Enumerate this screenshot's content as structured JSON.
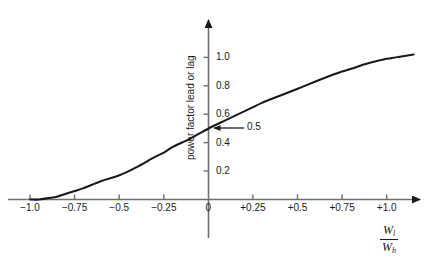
{
  "chart_data": {
    "type": "line",
    "title": "",
    "xlabel": "W_l / W_h",
    "ylabel": "power factor lead or lag",
    "xlim": [
      -1.12,
      1.24
    ],
    "ylim": [
      0,
      1.18
    ],
    "grid": false,
    "legend": null,
    "x_ticks": [
      {
        "value": -1.0,
        "label": "−1.0"
      },
      {
        "value": -0.75,
        "label": "−0.75"
      },
      {
        "value": -0.5,
        "label": "−0.5"
      },
      {
        "value": -0.25,
        "label": "−0.25"
      },
      {
        "value": 0,
        "label": "0"
      },
      {
        "value": 0.25,
        "label": "+0.25"
      },
      {
        "value": 0.5,
        "label": "+0.5"
      },
      {
        "value": 0.75,
        "label": "+0.75"
      },
      {
        "value": 1.0,
        "label": "+1.0"
      }
    ],
    "y_ticks": [
      {
        "value": 0.2,
        "label": "0.2"
      },
      {
        "value": 0.4,
        "label": "0.4"
      },
      {
        "value": 0.6,
        "label": "0.6"
      },
      {
        "value": 0.8,
        "label": "0.8"
      },
      {
        "value": 1.0,
        "label": "1.0"
      }
    ],
    "series": [
      {
        "name": "power factor",
        "x": [
          -1.0,
          -0.95,
          -0.9,
          -0.85,
          -0.8,
          -0.75,
          -0.7,
          -0.6,
          -0.5,
          -0.4,
          -0.3,
          -0.25,
          -0.2,
          -0.1,
          0.0,
          0.1,
          0.2,
          0.25,
          0.3,
          0.4,
          0.5,
          0.6,
          0.7,
          0.75,
          0.8,
          0.9,
          1.0,
          1.1,
          1.15
        ],
        "values": [
          0.0,
          0.0,
          0.01,
          0.02,
          0.04,
          0.06,
          0.08,
          0.13,
          0.17,
          0.23,
          0.3,
          0.33,
          0.37,
          0.43,
          0.5,
          0.56,
          0.62,
          0.65,
          0.68,
          0.73,
          0.78,
          0.83,
          0.88,
          0.9,
          0.92,
          0.96,
          0.99,
          1.01,
          1.02
        ]
      }
    ],
    "annotations": [
      {
        "text": "0.5",
        "point_x": 0.0,
        "point_y": 0.5,
        "label_x": 0.22,
        "label_y": 0.5,
        "arrow": "left"
      }
    ],
    "axes_style": {
      "line_color": "#6e6e6e",
      "curve_color": "#1a1a1a",
      "arrow_heads": [
        "x-right",
        "y-up"
      ]
    }
  },
  "axis_titles": {
    "y": "power factor lead or lag",
    "x_numerator": "W",
    "x_numerator_sub": "l",
    "x_denominator": "W",
    "x_denominator_sub": "h"
  }
}
